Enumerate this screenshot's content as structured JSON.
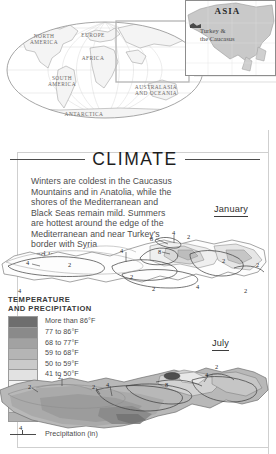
{
  "world_map": {
    "region_labels": [
      {
        "name": "north-america",
        "text": "NORTH\nAMERICA",
        "x": 40,
        "y": 37
      },
      {
        "name": "south-america",
        "text": "SOUTH\nAMERICA",
        "x": 58,
        "y": 79
      },
      {
        "name": "europe",
        "text": "EUROPE",
        "x": 92,
        "y": 35
      },
      {
        "name": "africa",
        "text": "AFRICA",
        "x": 92,
        "y": 58
      },
      {
        "name": "australasia",
        "text": "AUSTRALASIA\nAND OCEANIA",
        "x": 150,
        "y": 88
      },
      {
        "name": "antarctica",
        "text": "ANTARCTICA",
        "x": 80,
        "y": 114
      }
    ]
  },
  "inset": {
    "title": "ASIA",
    "subtitle": "Turkey &\nthe Caucasus"
  },
  "section": {
    "heading": "CLIMATE",
    "body": "Winters are coldest in the Caucasus\nMountains and in Anatolia, while the\nshores of the Mediterranean and\nBlack Seas remain mild. Summers\nare hottest around the edge of the\nMediterranean and near Turkey's\nborder with Syria\nand Iraq."
  },
  "maps": {
    "january": {
      "label": "January",
      "precip_values": [
        {
          "v": "8",
          "x": 150,
          "y": 18
        },
        {
          "v": "4",
          "x": 172,
          "y": 12
        },
        {
          "v": "2",
          "x": 187,
          "y": 16
        },
        {
          "v": "4",
          "x": 120,
          "y": 30
        },
        {
          "v": "8",
          "x": 158,
          "y": 31
        },
        {
          "v": "4",
          "x": 26,
          "y": 42
        },
        {
          "v": "2",
          "x": 68,
          "y": 44
        },
        {
          "v": "2",
          "x": 222,
          "y": 40
        },
        {
          "v": "2",
          "x": 256,
          "y": 44
        },
        {
          "v": "2",
          "x": 130,
          "y": 56
        },
        {
          "v": "2",
          "x": 152,
          "y": 68
        },
        {
          "v": "4",
          "x": 196,
          "y": 66
        },
        {
          "v": "2",
          "x": 244,
          "y": 70
        },
        {
          "v": "4",
          "x": 18,
          "y": 70
        }
      ]
    },
    "july": {
      "label": "July",
      "precip_values": [
        {
          "v": "2",
          "x": 28,
          "y": 28
        },
        {
          "v": "2",
          "x": 58,
          "y": 18
        },
        {
          "v": "2",
          "x": 92,
          "y": 28
        },
        {
          "v": "4",
          "x": 106,
          "y": 26
        },
        {
          "v": "8",
          "x": 165,
          "y": 26
        },
        {
          "v": "4",
          "x": 205,
          "y": 16
        },
        {
          "v": "2",
          "x": 215,
          "y": 8
        }
      ]
    }
  },
  "legend": {
    "title": "TEMPERATURE\nAND PRECIPITATION",
    "entries": [
      {
        "label": "More than 86°F",
        "color": "#6e6e6e"
      },
      {
        "label": "77 to 86°F",
        "color": "#8a8a8a"
      },
      {
        "label": "68 to 77°F",
        "color": "#a2a2a2"
      },
      {
        "label": "59 to 68°F",
        "color": "#b5b5b5"
      },
      {
        "label": "50 to 59°F",
        "color": "#cacaca"
      },
      {
        "label": "41 to 50°F",
        "color": "#e2e2e2"
      },
      {
        "label": "32 to 41°F",
        "color": "#f3f3f3"
      },
      {
        "label": "23 to 32°F",
        "color": "#fbfbfb"
      },
      {
        "label": "14 to 23°F",
        "color": "#d8d8d8"
      },
      {
        "label": "Less than 14°F",
        "color": "#b0b0b0"
      }
    ],
    "precipitation": {
      "value": "4",
      "label": "Precipitation (in)"
    }
  }
}
